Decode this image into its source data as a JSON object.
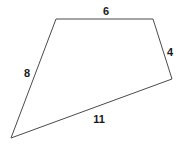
{
  "figure": {
    "name": "quadrilateral",
    "shape_type": "quadrilateral",
    "background_color": "#ffffff",
    "stroke_color": "#4a4a4a",
    "stroke_width": 1,
    "label_color": "#1a1a1a",
    "vertices": [
      {
        "name": "top-left",
        "x": 56,
        "y": 19
      },
      {
        "name": "top-right",
        "x": 153,
        "y": 19
      },
      {
        "name": "right",
        "x": 172,
        "y": 79
      },
      {
        "name": "bottom-left",
        "x": 11,
        "y": 138
      }
    ],
    "polygon_points": "56,19 153,19 172,79 11,138",
    "sides": [
      {
        "name": "top-side",
        "label": "6",
        "from": "top-left",
        "to": "top-right",
        "label_x": 106,
        "label_y": 11
      },
      {
        "name": "right-side",
        "label": "4",
        "from": "top-right",
        "to": "right",
        "label_x": 170,
        "label_y": 52
      },
      {
        "name": "bottom-side",
        "label": "11",
        "from": "right",
        "to": "bottom-left",
        "label_x": 99,
        "label_y": 119
      },
      {
        "name": "left-side",
        "label": "8",
        "from": "bottom-left",
        "to": "top-left",
        "label_x": 27,
        "label_y": 73
      }
    ]
  }
}
